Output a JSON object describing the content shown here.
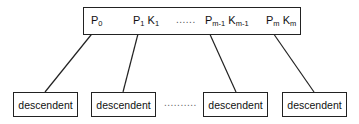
{
  "diagram": {
    "type": "b-tree-node",
    "node": {
      "entries": [
        {
          "pointer": "P",
          "pointer_sub": "0",
          "key": "",
          "key_sub": ""
        },
        {
          "pointer": "P",
          "pointer_sub": "1",
          "key": "K",
          "key_sub": "1"
        },
        {
          "pointer": "P",
          "pointer_sub": "m-1",
          "key": "K",
          "key_sub": "m-1"
        },
        {
          "pointer": "P",
          "pointer_sub": "m",
          "key": "K",
          "key_sub": "m"
        }
      ],
      "ellipsis": "......"
    },
    "children": [
      {
        "label": "descendent"
      },
      {
        "label": "descendent"
      },
      {
        "label": "descendent"
      },
      {
        "label": "descendent"
      }
    ],
    "children_ellipsis": "..........",
    "colors": {
      "stroke": "#222222",
      "background": "#ffffff"
    }
  }
}
